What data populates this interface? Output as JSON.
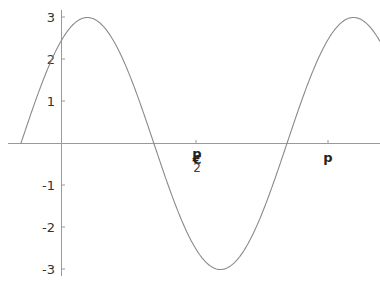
{
  "chart_data": {
    "type": "line",
    "title": "",
    "xlabel": "",
    "ylabel": "",
    "function": "3 sin(2x + 0.96)",
    "xlim": [
      -0.48,
      3.76
    ],
    "ylim": [
      -3.1,
      3.1
    ],
    "grid": false,
    "legend": null,
    "y_ticks": [
      {
        "value": 3,
        "label": "3"
      },
      {
        "value": 2,
        "label": "2"
      },
      {
        "value": 1,
        "label": "1"
      },
      {
        "value": -1,
        "label": "-1"
      },
      {
        "value": -2,
        "label": "-2"
      },
      {
        "value": -3,
        "label": "-3"
      }
    ],
    "x_ticks": [
      {
        "value": 1.5708,
        "label": "p/2 (rendered as overlapping 'p', '€', '2' glyphs)",
        "display": "p€2"
      },
      {
        "value": 3.1416,
        "label": "p",
        "display": "p"
      }
    ],
    "series": [
      {
        "name": "f(x)",
        "color": "#888888",
        "points": [
          {
            "x": -0.48,
            "y": 0.0
          },
          {
            "x": 0.0,
            "y": 2.45
          },
          {
            "x": 0.31,
            "y": 3.0
          },
          {
            "x": 1.09,
            "y": 0.0
          },
          {
            "x": 1.88,
            "y": -3.0
          },
          {
            "x": 2.66,
            "y": 0.0
          },
          {
            "x": 3.45,
            "y": 3.0
          }
        ]
      }
    ]
  },
  "labels": {
    "y3": "3",
    "y2": "2",
    "y1": "1",
    "yn1": "-1",
    "yn2": "-2",
    "yn3": "-3",
    "x_pi_half_top": "p",
    "x_pi_half_mid": "€",
    "x_pi_half_bottom": "2",
    "x_pi": "p"
  },
  "colors": {
    "axis": "#9a9a9a",
    "curve": "#8a8a8a",
    "text": "#333333"
  }
}
